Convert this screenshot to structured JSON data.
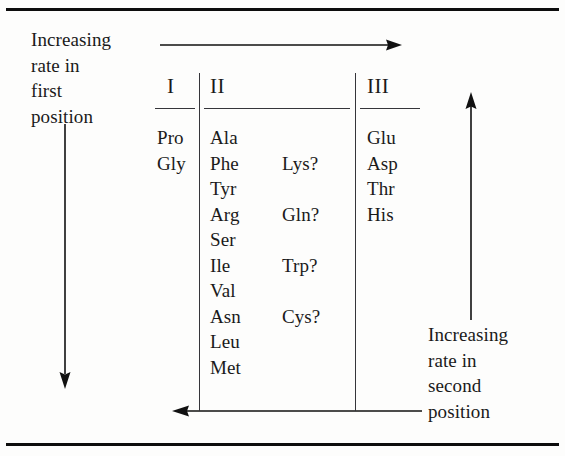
{
  "figure": {
    "background_color": "#fdfdfc",
    "ink_color": "#1a1a1a",
    "rule_color": "#0d0d0d"
  },
  "captions": {
    "first_position": "Increasing\nrate in\nfirst\nposition",
    "second_position": "Increasing\nrate in\nsecond\nposition"
  },
  "arrows": {
    "top": "arrow-right-horizontal",
    "bottom": "arrow-left-horizontal",
    "left": "arrow-down-vertical",
    "right": "arrow-up-vertical"
  },
  "table": {
    "headers": [
      "I",
      "II",
      "III"
    ],
    "column_1": [
      "Pro",
      "Gly"
    ],
    "column_2": [
      "Ala",
      "Phe",
      "Tyr",
      "Arg",
      "Ser",
      "Ile",
      "Val",
      "Asn",
      "Leu",
      "Met"
    ],
    "column_2_secondary": [
      {
        "row": 2,
        "label": "Lys?"
      },
      {
        "row": 4,
        "label": "Gln?"
      },
      {
        "row": 6,
        "label": "Trp?"
      },
      {
        "row": 8,
        "label": "Cys?"
      }
    ],
    "column_3": [
      "Glu",
      "Asp",
      "Thr",
      "His"
    ]
  }
}
